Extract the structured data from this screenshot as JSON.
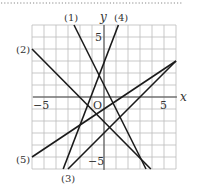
{
  "figure": {
    "axis_labels": {
      "x": "x",
      "y": "y",
      "origin": "O"
    },
    "ticks": {
      "x_neg": "−5",
      "x_pos": "5",
      "y_pos": "5",
      "y_neg": "−5"
    },
    "line_labels": [
      "(1)",
      "(2)",
      "(3)",
      "(4)",
      "(5)"
    ],
    "grid": {
      "xmin": -6,
      "xmax": 6,
      "ymin": -6,
      "ymax": 6,
      "step": 1
    },
    "colors": {
      "grid": "#bbbbbb",
      "axis": "#444444",
      "line": "#1a1a1a",
      "dots": "#888888"
    }
  },
  "chart_data": {
    "type": "line",
    "title": "",
    "xlabel": "x",
    "ylabel": "y",
    "xlim": [
      -6,
      6
    ],
    "ylim": [
      -6,
      6
    ],
    "grid": true,
    "series": [
      {
        "name": "(1)",
        "equation": "y = -2x + 1",
        "points": [
          [
            -2.5,
            6
          ],
          [
            3.5,
            -6
          ]
        ]
      },
      {
        "name": "(2)",
        "equation": "y ≈ -x - 2",
        "points": [
          [
            -6,
            4
          ],
          [
            3.9,
            -6
          ]
        ]
      },
      {
        "name": "(3)",
        "equation": "y = x - 3",
        "points": [
          [
            -3,
            -6
          ],
          [
            6,
            3
          ]
        ]
      },
      {
        "name": "(4)",
        "equation": "y ≈ 2.5x + 3",
        "points": [
          [
            1.2,
            6
          ],
          [
            -3.4,
            -6
          ]
        ]
      },
      {
        "name": "(5)",
        "equation": "y ≈ (2/3)x - 1",
        "points": [
          [
            -6,
            -5
          ],
          [
            6,
            3
          ]
        ]
      }
    ]
  }
}
